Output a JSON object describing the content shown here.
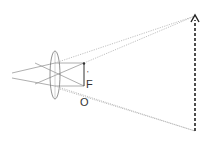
{
  "diagram": {
    "labels": {
      "focal_point": "F",
      "object_label": "O",
      "focal_tick": "'"
    },
    "colors": {
      "ray": "#9a9a9a",
      "solid": "#555555",
      "object": "#333333",
      "image": "#222222",
      "lens": "#777777"
    },
    "elements": {
      "lens": {
        "cx": 55,
        "cy": 75,
        "rx": 5,
        "ry": 24
      },
      "object_arrow": {
        "x": 84,
        "y_top": 63,
        "y_bottom": 86
      },
      "image_arrow": {
        "x": 195,
        "y_top": 16,
        "y_bottom": 131,
        "style": "dashed"
      }
    }
  }
}
